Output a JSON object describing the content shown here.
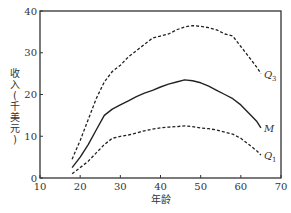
{
  "chart_data": {
    "type": "line",
    "title": "",
    "xlabel": "年龄",
    "ylabel": "收入(千美元)",
    "xlim": [
      10,
      70
    ],
    "ylim": [
      0,
      40
    ],
    "xticks": [
      10,
      20,
      30,
      40,
      50,
      60,
      70
    ],
    "yticks": [
      0,
      10,
      20,
      30,
      40
    ],
    "grid": false,
    "legend": "inline labels at right end of each curve",
    "x": [
      18,
      20,
      22,
      24,
      26,
      28,
      30,
      32,
      34,
      36,
      38,
      40,
      42,
      44,
      46,
      48,
      50,
      52,
      54,
      56,
      58,
      60,
      62,
      64,
      65
    ],
    "series": [
      {
        "name": "Q3",
        "label": "Q",
        "sub": "3",
        "style": "dashed",
        "values": [
          4.5,
          9,
          14,
          19,
          23,
          25.5,
          27,
          29,
          30.5,
          32,
          33.5,
          34,
          34.5,
          35.5,
          36.2,
          36.5,
          36.3,
          36,
          35.5,
          34.5,
          34,
          31.5,
          29,
          26.5,
          25
        ]
      },
      {
        "name": "M",
        "label": "M",
        "sub": "",
        "style": "solid",
        "values": [
          2.5,
          5,
          8,
          11.5,
          15,
          16.5,
          17.5,
          18.5,
          19.5,
          20.3,
          21,
          21.8,
          22.5,
          23,
          23.5,
          23.3,
          22.8,
          22,
          21,
          20,
          19,
          17.5,
          15.5,
          13.5,
          12
        ]
      },
      {
        "name": "Q1",
        "label": "Q",
        "sub": "1",
        "style": "dashed",
        "values": [
          1,
          2.5,
          4,
          6,
          8,
          9.5,
          10,
          10.3,
          10.8,
          11.3,
          11.7,
          12,
          12.2,
          12.3,
          12.5,
          12.3,
          12,
          11.8,
          11.5,
          11,
          10.5,
          9.5,
          8,
          6.5,
          5.5
        ]
      }
    ]
  },
  "axes": {
    "xlabel": "年龄",
    "ylabel_chars": [
      "收",
      "入",
      "(",
      "千",
      "美",
      "元",
      ")"
    ]
  }
}
